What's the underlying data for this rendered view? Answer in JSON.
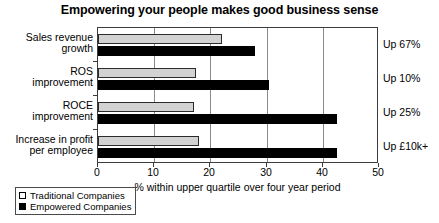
{
  "chart_data": {
    "type": "bar",
    "orientation": "horizontal",
    "title": "Empowering your people makes good business sense",
    "xlabel": "% within upper quartile over four year period",
    "ylabel": "",
    "xlim": [
      0,
      50
    ],
    "xticks": [
      0,
      10,
      20,
      30,
      40,
      50
    ],
    "xticklabels": [
      "0",
      "10",
      "20",
      "30",
      "40",
      "50"
    ],
    "grid": true,
    "legend_position": "below-left",
    "categories": [
      "Sales revenue growth",
      "ROS improvement",
      "ROCE improvement",
      "Increase in profit per employee"
    ],
    "category_lines": [
      [
        "Sales revenue",
        "growth"
      ],
      [
        "ROS",
        "improvement"
      ],
      [
        "ROCE",
        "improvement"
      ],
      [
        "Increase in profit",
        "per employee"
      ]
    ],
    "series": [
      {
        "name": "Traditional Companies",
        "color": "#d2d2d2",
        "values": [
          22,
          17.5,
          17,
          18
        ]
      },
      {
        "name": "Empowered Companies",
        "color": "#000000",
        "values": [
          28,
          30.5,
          42.5,
          42.5
        ]
      }
    ],
    "annotations": [
      "Up 67%",
      "Up 10%",
      "Up 25%",
      "Up £10k+"
    ]
  }
}
